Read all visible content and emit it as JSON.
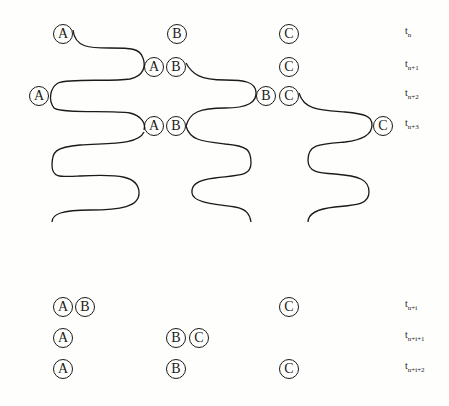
{
  "diagram": {
    "stroke_color": "#1a1a1a",
    "background": "#fefefc",
    "time_labels": [
      {
        "base": "t",
        "sub": "n",
        "y": 34
      },
      {
        "base": "t",
        "sub": "n+1",
        "y": 67
      },
      {
        "base": "t",
        "sub": "n+2",
        "y": 96
      },
      {
        "base": "t",
        "sub": "n+3",
        "y": 126
      },
      {
        "base": "t",
        "sub": "n+i",
        "y": 307
      },
      {
        "base": "t",
        "sub": "n+i+1",
        "y": 338
      },
      {
        "base": "t",
        "sub": "n+i+2",
        "y": 369
      }
    ],
    "nodes": [
      {
        "label": "A",
        "x": 63,
        "y": 34
      },
      {
        "label": "B",
        "x": 177,
        "y": 34
      },
      {
        "label": "C",
        "x": 289,
        "y": 34
      },
      {
        "label": "A",
        "x": 154,
        "y": 67
      },
      {
        "label": "B",
        "x": 176,
        "y": 67
      },
      {
        "label": "C",
        "x": 289,
        "y": 67
      },
      {
        "label": "A",
        "x": 39,
        "y": 96
      },
      {
        "label": "B",
        "x": 266,
        "y": 96
      },
      {
        "label": "C",
        "x": 289,
        "y": 96
      },
      {
        "label": "A",
        "x": 154,
        "y": 126
      },
      {
        "label": "B",
        "x": 176,
        "y": 126
      },
      {
        "label": "C",
        "x": 383,
        "y": 126
      },
      {
        "label": "A",
        "x": 63,
        "y": 307
      },
      {
        "label": "B",
        "x": 85,
        "y": 307
      },
      {
        "label": "C",
        "x": 289,
        "y": 307
      },
      {
        "label": "A",
        "x": 63,
        "y": 338
      },
      {
        "label": "B",
        "x": 176,
        "y": 338
      },
      {
        "label": "C",
        "x": 199,
        "y": 338
      },
      {
        "label": "A",
        "x": 63,
        "y": 369
      },
      {
        "label": "B",
        "x": 176,
        "y": 369
      },
      {
        "label": "C",
        "x": 289,
        "y": 369
      }
    ]
  }
}
